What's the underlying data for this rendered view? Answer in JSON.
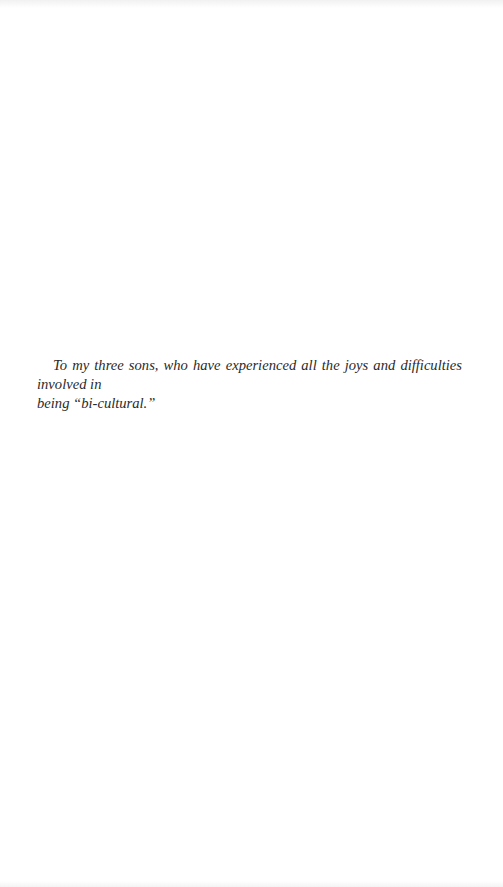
{
  "page": {
    "type": "dedication",
    "text_line1": "To my three sons, who have experienced all the joys and difficulties involved in",
    "text_line2": "being “bi-cultural.”"
  }
}
